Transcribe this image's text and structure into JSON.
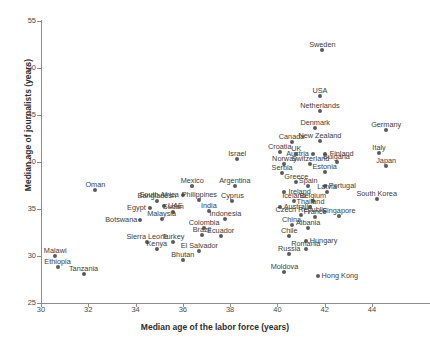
{
  "chart_data": {
    "type": "scatter",
    "title": "",
    "xlabel": "Median age of the labor force (years)",
    "ylabel": "Median age of journalists (years)",
    "xlim": [
      30,
      45.5
    ],
    "ylim": [
      25,
      55
    ],
    "xticks": [
      30,
      32,
      34,
      36,
      38,
      40,
      42,
      44
    ],
    "yticks": [
      25,
      30,
      35,
      40,
      45,
      50,
      55
    ],
    "grid": false,
    "legend": "none",
    "marker_color": "#5b5b5b",
    "points": [
      {
        "label": "Sweden",
        "x": 41.9,
        "y": 51.9,
        "lx": 0,
        "ly": -9,
        "a": "c"
      },
      {
        "label": "USA",
        "x": 41.8,
        "y": 47.0,
        "lx": 0,
        "ly": -9,
        "a": "c"
      },
      {
        "label": "Netherlands",
        "x": 41.8,
        "y": 45.4,
        "lx": 0,
        "ly": -9,
        "a": "c"
      },
      {
        "label": "Denmark",
        "x": 41.6,
        "y": 43.6,
        "lx": 0,
        "ly": -9,
        "a": "c"
      },
      {
        "label": "Germany",
        "x": 44.6,
        "y": 43.4,
        "lx": 0,
        "ly": -9,
        "a": "c"
      },
      {
        "label": "New Zealand",
        "x": 41.8,
        "y": 42.2,
        "lx": 0,
        "ly": -9,
        "a": "c"
      },
      {
        "label": "Canada",
        "x": 40.6,
        "y": 42.1,
        "lx": 0,
        "ly": -9,
        "a": "c"
      },
      {
        "label": "Finland",
        "x": 42.0,
        "y": 40.9,
        "lx": 5,
        "ly": -4,
        "a": "l"
      },
      {
        "label": "Austria",
        "x": 41.5,
        "y": 40.9,
        "lx": -4,
        "ly": -4,
        "a": "r"
      },
      {
        "label": "UK",
        "x": 40.8,
        "y": 40.9,
        "lx": 0,
        "ly": -9,
        "a": "c"
      },
      {
        "label": "Croatia",
        "x": 40.1,
        "y": 41.1,
        "lx": 0,
        "ly": -9,
        "a": "c"
      },
      {
        "label": "Italy",
        "x": 44.3,
        "y": 41.0,
        "lx": 0,
        "ly": -9,
        "a": "c"
      },
      {
        "label": "Switzerland",
        "x": 41.4,
        "y": 39.8,
        "lx": 0,
        "ly": -9,
        "a": "c"
      },
      {
        "label": "Bulgaria",
        "x": 42.5,
        "y": 40.0,
        "lx": 0,
        "ly": -9,
        "a": "c"
      },
      {
        "label": "Norway",
        "x": 40.3,
        "y": 39.8,
        "lx": 0,
        "ly": -9,
        "a": "c"
      },
      {
        "label": "Japan",
        "x": 44.6,
        "y": 39.6,
        "lx": 0,
        "ly": -9,
        "a": "c"
      },
      {
        "label": "Estonia",
        "x": 42.0,
        "y": 38.9,
        "lx": 0,
        "ly": -9,
        "a": "c"
      },
      {
        "label": "Serbia",
        "x": 40.2,
        "y": 38.8,
        "lx": 0,
        "ly": -9,
        "a": "c"
      },
      {
        "label": "Israel",
        "x": 38.3,
        "y": 40.3,
        "lx": 0,
        "ly": -9,
        "a": "c"
      },
      {
        "label": "Greece",
        "x": 40.8,
        "y": 37.9,
        "lx": 0,
        "ly": -9,
        "a": "c"
      },
      {
        "label": "Spain",
        "x": 41.3,
        "y": 37.4,
        "lx": 0,
        "ly": -9,
        "a": "c"
      },
      {
        "label": "Portugal",
        "x": 42.0,
        "y": 37.4,
        "lx": 4,
        "ly": -4,
        "a": "l"
      },
      {
        "label": "Ireland",
        "x": 40.3,
        "y": 36.8,
        "lx": 4,
        "ly": -4,
        "a": "l"
      },
      {
        "label": "Latvia",
        "x": 42.1,
        "y": 36.8,
        "lx": 0,
        "ly": -9,
        "a": "c"
      },
      {
        "label": "Iceland",
        "x": 40.7,
        "y": 35.9,
        "lx": 0,
        "ly": -9,
        "a": "c"
      },
      {
        "label": "Belgium",
        "x": 41.5,
        "y": 35.9,
        "lx": 0,
        "ly": -9,
        "a": "c"
      },
      {
        "label": "South Korea",
        "x": 44.2,
        "y": 36.1,
        "lx": 0,
        "ly": -9,
        "a": "c"
      },
      {
        "label": "Australia",
        "x": 40.1,
        "y": 35.2,
        "lx": 4,
        "ly": -4,
        "a": "l"
      },
      {
        "label": "Thailand",
        "x": 41.4,
        "y": 35.2,
        "lx": 0,
        "ly": -9,
        "a": "c"
      },
      {
        "label": "Czech Republic",
        "x": 41.0,
        "y": 34.4,
        "lx": 0,
        "ly": -9,
        "a": "c"
      },
      {
        "label": "France",
        "x": 41.6,
        "y": 34.2,
        "lx": 0,
        "ly": -9,
        "a": "c"
      },
      {
        "label": "Singapore",
        "x": 42.6,
        "y": 34.3,
        "lx": 0,
        "ly": -9,
        "a": "c"
      },
      {
        "label": "China",
        "x": 40.6,
        "y": 33.3,
        "lx": 0,
        "ly": -9,
        "a": "c"
      },
      {
        "label": "Albania",
        "x": 41.3,
        "y": 33.0,
        "lx": 0,
        "ly": -9,
        "a": "c"
      },
      {
        "label": "Chile",
        "x": 40.5,
        "y": 32.1,
        "lx": 0,
        "ly": -9,
        "a": "c"
      },
      {
        "label": "Hungary",
        "x": 41.2,
        "y": 31.6,
        "lx": 4,
        "ly": -4,
        "a": "l"
      },
      {
        "label": "Romania",
        "x": 41.2,
        "y": 30.7,
        "lx": 0,
        "ly": -9,
        "a": "c"
      },
      {
        "label": "Russia",
        "x": 40.5,
        "y": 30.2,
        "lx": 0,
        "ly": -9,
        "a": "c"
      },
      {
        "label": "Moldova",
        "x": 40.3,
        "y": 28.3,
        "lx": 0,
        "ly": -9,
        "a": "c"
      },
      {
        "label": "Hong Kong",
        "x": 41.7,
        "y": 27.9,
        "lx": 4,
        "ly": -4,
        "a": "l"
      },
      {
        "label": "Argentina",
        "x": 38.2,
        "y": 37.4,
        "lx": 0,
        "ly": -9,
        "a": "c"
      },
      {
        "label": "Mexico",
        "x": 36.4,
        "y": 37.5,
        "lx": 0,
        "ly": -9,
        "a": "c"
      },
      {
        "label": "Oman",
        "x": 32.3,
        "y": 37.0,
        "lx": 0,
        "ly": -9,
        "a": "c"
      },
      {
        "label": "South Africa",
        "x": 36.0,
        "y": 36.5,
        "lx": -4,
        "ly": -4,
        "a": "r"
      },
      {
        "label": "Philippines",
        "x": 36.7,
        "y": 36.0,
        "lx": 0,
        "ly": -9,
        "a": "c"
      },
      {
        "label": "Bangladesh",
        "x": 34.9,
        "y": 35.9,
        "lx": 0,
        "ly": -9,
        "a": "c"
      },
      {
        "label": "Cyprus",
        "x": 38.1,
        "y": 35.9,
        "lx": 0,
        "ly": -9,
        "a": "c"
      },
      {
        "label": "UAE",
        "x": 35.2,
        "y": 35.3,
        "lx": 4,
        "ly": -4,
        "a": "l"
      },
      {
        "label": "Egypt",
        "x": 34.6,
        "y": 35.1,
        "lx": -4,
        "ly": -4,
        "a": "r"
      },
      {
        "label": "Sudan",
        "x": 35.6,
        "y": 34.7,
        "lx": 0,
        "ly": -9,
        "a": "c"
      },
      {
        "label": "India",
        "x": 37.1,
        "y": 34.8,
        "lx": 0,
        "ly": -9,
        "a": "c"
      },
      {
        "label": "Indonesia",
        "x": 37.8,
        "y": 33.9,
        "lx": 0,
        "ly": -9,
        "a": "c"
      },
      {
        "label": "Malaysia",
        "x": 35.1,
        "y": 33.9,
        "lx": 0,
        "ly": -9,
        "a": "c"
      },
      {
        "label": "Botswana",
        "x": 34.2,
        "y": 33.8,
        "lx": -3,
        "ly": -4,
        "a": "r"
      },
      {
        "label": "Colombia",
        "x": 36.9,
        "y": 33.0,
        "lx": 0,
        "ly": -9,
        "a": "c"
      },
      {
        "label": "Brazil",
        "x": 36.8,
        "y": 32.2,
        "lx": 0,
        "ly": -9,
        "a": "c"
      },
      {
        "label": "Ecuador",
        "x": 37.6,
        "y": 32.1,
        "lx": 0,
        "ly": -9,
        "a": "c"
      },
      {
        "label": "Turkey",
        "x": 35.6,
        "y": 31.5,
        "lx": 0,
        "ly": -9,
        "a": "c"
      },
      {
        "label": "Sierra Leone",
        "x": 34.5,
        "y": 31.5,
        "lx": 0,
        "ly": -9,
        "a": "c"
      },
      {
        "label": "Kenya",
        "x": 34.9,
        "y": 30.7,
        "lx": 0,
        "ly": -9,
        "a": "c"
      },
      {
        "label": "El Salvador",
        "x": 36.7,
        "y": 30.5,
        "lx": 0,
        "ly": -9,
        "a": "c"
      },
      {
        "label": "Bhutan",
        "x": 36.0,
        "y": 29.6,
        "lx": 0,
        "ly": -9,
        "a": "c"
      },
      {
        "label": "Malawi",
        "x": 30.6,
        "y": 30.0,
        "lx": 0,
        "ly": -9,
        "a": "c"
      },
      {
        "label": "Ethiopia",
        "x": 30.7,
        "y": 28.8,
        "lx": 0,
        "ly": -9,
        "a": "c"
      },
      {
        "label": "Tanzania",
        "x": 31.8,
        "y": 28.1,
        "lx": 0,
        "ly": -9,
        "a": "c"
      }
    ]
  }
}
